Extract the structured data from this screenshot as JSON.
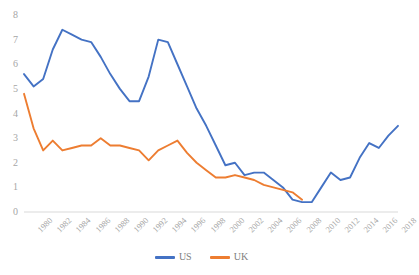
{
  "chart_data": {
    "type": "line",
    "title": "",
    "subtitle": "",
    "xlabel": "",
    "ylabel": "",
    "xlim": [
      1980,
      2019
    ],
    "ylim": [
      0,
      8
    ],
    "ytick_values": [
      0,
      1,
      2,
      3,
      4,
      5,
      6,
      7,
      8
    ],
    "xtick_labels": [
      "1980",
      "1982",
      "1984",
      "1986",
      "1988",
      "1990",
      "1992",
      "1994",
      "1996",
      "1998",
      "2000",
      "2002",
      "2004",
      "2006",
      "2008",
      "2010",
      "2012",
      "2014",
      "2016",
      "2018"
    ],
    "grid": false,
    "legend_position": "bottom",
    "series": [
      {
        "name": "US",
        "color": "#4472C4",
        "x": [
          1980,
          1981,
          1982,
          1983,
          1984,
          1985,
          1986,
          1987,
          1988,
          1989,
          1990,
          1991,
          1992,
          1993,
          1994,
          1995,
          1996,
          1997,
          1998,
          1999,
          2000,
          2001,
          2002,
          2003,
          2004,
          2005,
          2006,
          2007,
          2008,
          2009,
          2010,
          2011,
          2012,
          2013,
          2014,
          2015,
          2016,
          2017,
          2018,
          2019
        ],
        "values": [
          5.6,
          5.1,
          5.4,
          6.6,
          7.4,
          7.2,
          7.0,
          6.9,
          6.3,
          5.6,
          5.0,
          4.5,
          4.5,
          5.5,
          7.0,
          6.9,
          6.0,
          5.1,
          4.2,
          3.5,
          2.7,
          1.9,
          2.0,
          1.5,
          1.6,
          1.6,
          1.3,
          1.0,
          0.5,
          0.4,
          0.4,
          1.0,
          1.6,
          1.3,
          1.4,
          2.2,
          2.8,
          2.6,
          3.1,
          3.5
        ]
      },
      {
        "name": "UK",
        "color": "#ED7D31",
        "x": [
          1980,
          1981,
          1982,
          1983,
          1984,
          1985,
          1986,
          1987,
          1988,
          1989,
          1990,
          1991,
          1992,
          1993,
          1994,
          1995,
          1996,
          1997,
          1998,
          1999,
          2000,
          2001,
          2002,
          2003,
          2004,
          2005,
          2006,
          2007,
          2008,
          2009
        ],
        "values": [
          4.8,
          3.4,
          2.5,
          2.9,
          2.5,
          2.6,
          2.7,
          2.7,
          3.0,
          2.7,
          2.7,
          2.6,
          2.5,
          2.1,
          2.5,
          2.7,
          2.9,
          2.4,
          2.0,
          1.7,
          1.4,
          1.4,
          1.5,
          1.4,
          1.3,
          1.1,
          1.0,
          0.9,
          0.8,
          0.5
        ]
      }
    ]
  },
  "legend": {
    "entries": [
      {
        "label": "US",
        "color": "#4472C4"
      },
      {
        "label": "UK",
        "color": "#ED7D31"
      }
    ]
  },
  "axis": {
    "axis_line_color": "#d9d9d9",
    "tick_label_color": "#a6a6a6"
  }
}
